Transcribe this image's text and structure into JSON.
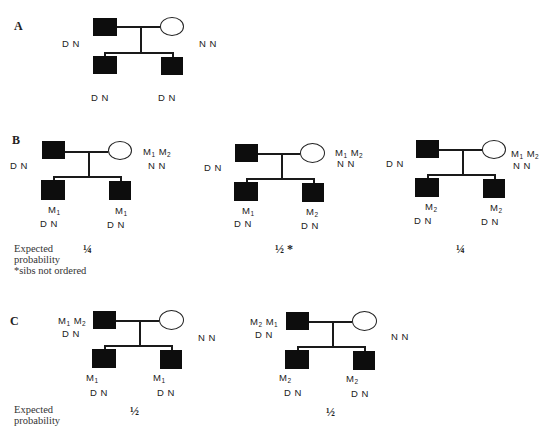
{
  "panels": {
    "A": {
      "label": "A",
      "father_genotype": "D N",
      "mother_genotype": "N N",
      "child1_genotype": "D N",
      "child2_genotype": "D N"
    },
    "B": {
      "label": "B",
      "expected_label_line1": "Expected",
      "expected_label_line2": "probability",
      "footnote": "*sibs not ordered",
      "pedigrees": [
        {
          "father_genotype": "D N",
          "mother_markers": [
            "M1",
            "M2"
          ],
          "mother_genotype": "N N",
          "child1_marker": "M1",
          "child1_genotype": "D N",
          "child2_marker": "M1",
          "child2_genotype": "D N",
          "probability": "¼"
        },
        {
          "father_genotype": "D N",
          "mother_markers": [
            "M1",
            "M2"
          ],
          "mother_genotype": "N N",
          "child1_marker": "M1",
          "child1_genotype": "D N",
          "child2_marker": "M2",
          "child2_genotype": "D N",
          "probability": "½ *"
        },
        {
          "father_genotype": "D N",
          "mother_markers": [
            "M1",
            "M2"
          ],
          "mother_genotype": "N N",
          "child1_marker": "M2",
          "child1_genotype": "D N",
          "child2_marker": "M2",
          "child2_genotype": "D N",
          "probability": "¼"
        }
      ]
    },
    "C": {
      "label": "C",
      "expected_label_line1": "Expected",
      "expected_label_line2": "probability",
      "pedigrees": [
        {
          "father_markers": [
            "M1",
            "M2"
          ],
          "father_genotype": "D N",
          "mother_genotype": "N N",
          "child1_marker": "M1",
          "child1_genotype": "D N",
          "child2_marker": "M1",
          "child2_genotype": "D N",
          "probability": "½"
        },
        {
          "father_markers": [
            "M2",
            "M1"
          ],
          "father_genotype": "D N",
          "mother_genotype": "N N",
          "child1_marker": "M2",
          "child1_genotype": "D N",
          "child2_marker": "M2",
          "child2_genotype": "D N",
          "probability": "½"
        }
      ]
    }
  },
  "legend": {
    "affected_male": "filled square",
    "unaffected_female": "open circle"
  }
}
